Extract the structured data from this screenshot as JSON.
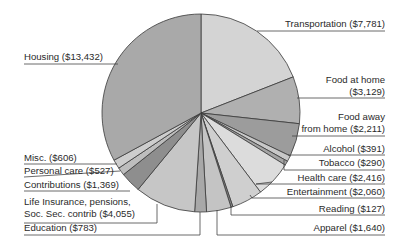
{
  "chart_data": {
    "type": "pie",
    "title": "",
    "unit": "USD",
    "start_angle_deg": 0,
    "direction": "clockwise",
    "total": 42837,
    "slices": [
      {
        "label": "Transportation",
        "value": 7781,
        "display": "Transportation ($7,781)",
        "color": "#d4d4d4"
      },
      {
        "label": "Food at home",
        "value": 3129,
        "display": "Food at home ($3,129)",
        "color": "#b0b0b0"
      },
      {
        "label": "Food away from home",
        "value": 2211,
        "display": "Food away from home ($2,211)",
        "color": "#9c9c9c"
      },
      {
        "label": "Alcohol",
        "value": 391,
        "display": "Alcohol ($391)",
        "color": "#c8c8c8"
      },
      {
        "label": "Tobacco",
        "value": 290,
        "display": "Tobacco ($290)",
        "color": "#a4a4a4"
      },
      {
        "label": "Health care",
        "value": 2416,
        "display": "Health care ($2,416)",
        "color": "#dcdcdc"
      },
      {
        "label": "Entertainment",
        "value": 2060,
        "display": "Entertainment ($2,060)",
        "color": "#cfcfcf"
      },
      {
        "label": "Reading",
        "value": 127,
        "display": "Reading ($127)",
        "color": "#8a8a8a"
      },
      {
        "label": "Apparel",
        "value": 1640,
        "display": "Apparel ($1,640)",
        "color": "#c4c4c4"
      },
      {
        "label": "Education",
        "value": 783,
        "display": "Education ($783)",
        "color": "#a8a8a8"
      },
      {
        "label": "Life Insurance, pensions, Soc. Sec. contrib",
        "value": 4055,
        "display": "Life Insurance, pensions, Soc. Sec. contrib ($4,055)",
        "color": "#c6c6c6"
      },
      {
        "label": "Contributions",
        "value": 1369,
        "display": "Contributions ($1,369)",
        "color": "#8e8e8e"
      },
      {
        "label": "Personal care",
        "value": 527,
        "display": "Personal care ($527)",
        "color": "#bdbdbd"
      },
      {
        "label": "Misc.",
        "value": 606,
        "display": "Misc. ($606)",
        "color": "#cdcdcd"
      },
      {
        "label": "Housing",
        "value": 13432,
        "display": "Housing ($13,432)",
        "color": "#a9a9a9"
      }
    ]
  },
  "labels": {
    "transportation": "Transportation ($7,781)",
    "food_home_1": "Food at home",
    "food_home_2": "($3,129)",
    "food_away_1": "Food away",
    "food_away_2": "from home ($2,211)",
    "alcohol": "Alcohol ($391)",
    "tobacco": "Tobacco ($290)",
    "health": "Health care ($2,416)",
    "entertainment": "Entertainment ($2,060)",
    "reading": "Reading ($127)",
    "apparel": "Apparel ($1,640)",
    "housing": "Housing ($13,432)",
    "misc": "Misc. ($606)",
    "personal": "Personal care ($527)",
    "contributions": "Contributions ($1,369)",
    "life_1": "Life Insurance, pensions,",
    "life_2": "Soc. Sec. contrib ($4,055)",
    "education": "Education ($783)"
  }
}
